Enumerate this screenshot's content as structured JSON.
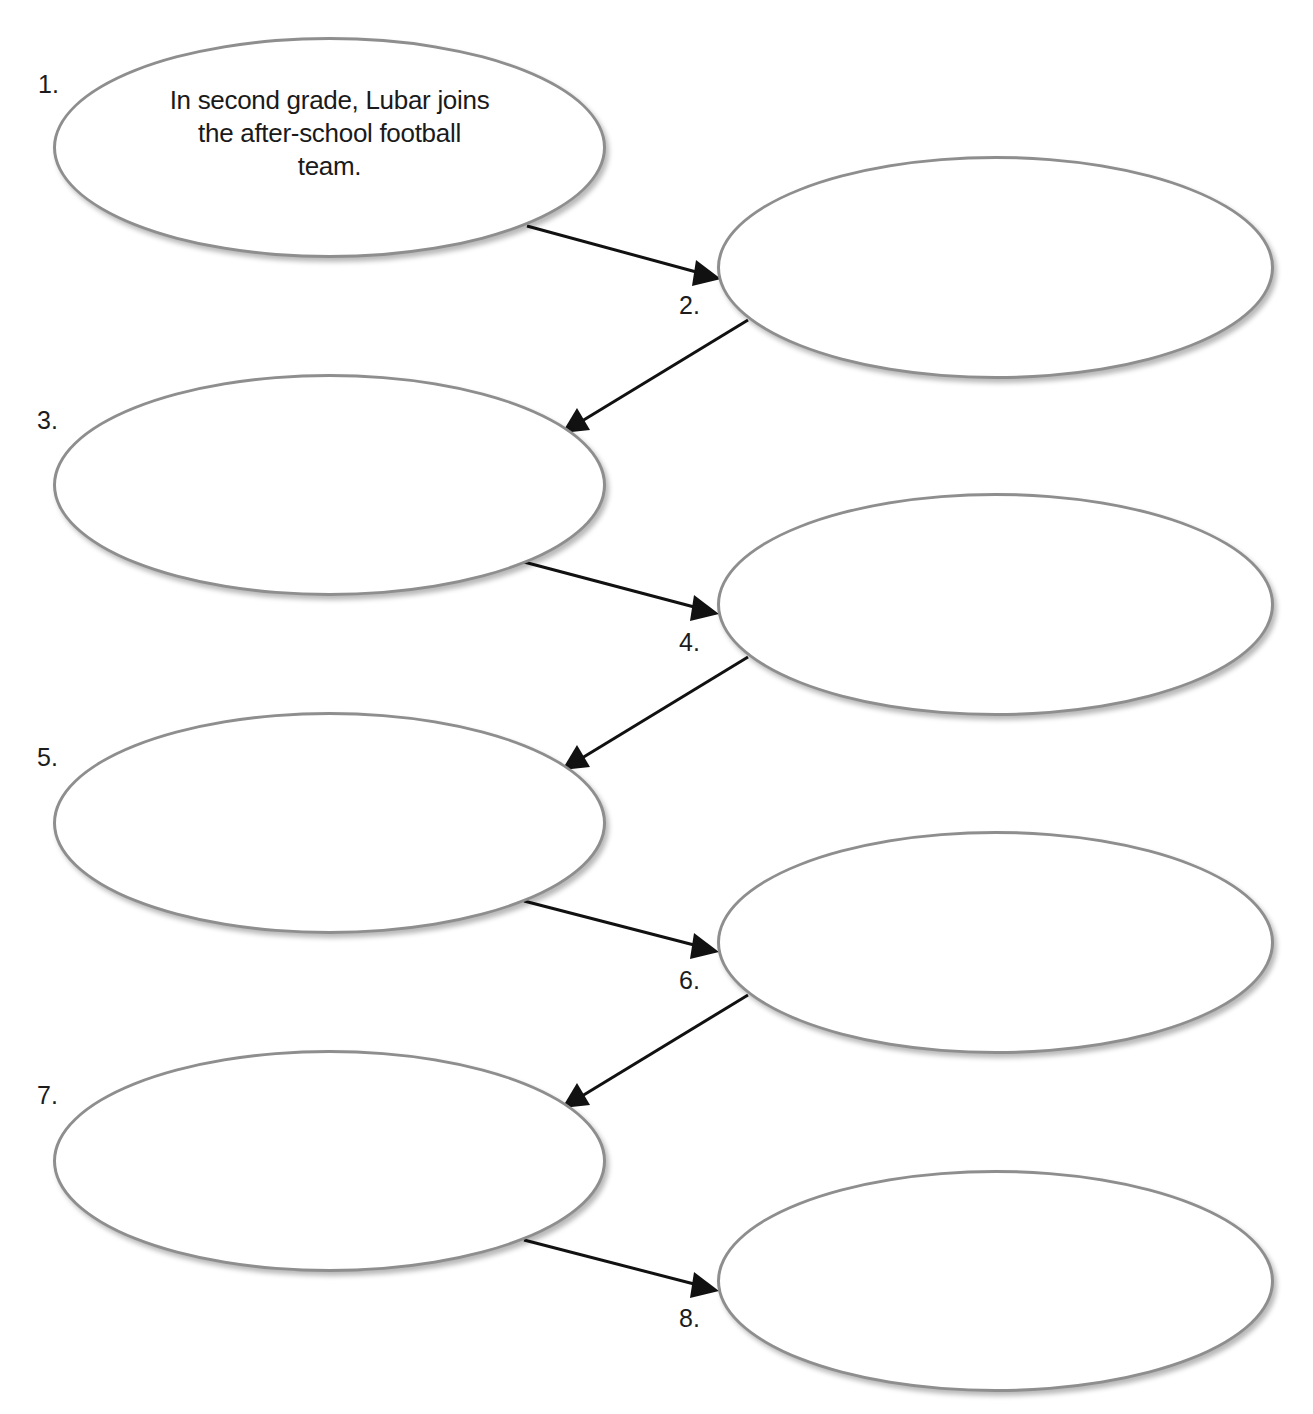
{
  "diagram": {
    "type": "sequence-chain",
    "line_color": "#111111",
    "ellipse_border_color": "#8e8e8e",
    "steps": [
      {
        "number": "1.",
        "text": "In second grade, Lubar joins the after-school football team."
      },
      {
        "number": "2.",
        "text": ""
      },
      {
        "number": "3.",
        "text": ""
      },
      {
        "number": "4.",
        "text": ""
      },
      {
        "number": "5.",
        "text": ""
      },
      {
        "number": "6.",
        "text": ""
      },
      {
        "number": "7.",
        "text": ""
      },
      {
        "number": "8.",
        "text": ""
      }
    ],
    "arrows": [
      {
        "from": "1",
        "to": "2"
      },
      {
        "from": "2",
        "to": "3"
      },
      {
        "from": "3",
        "to": "4"
      },
      {
        "from": "4",
        "to": "5"
      },
      {
        "from": "5",
        "to": "6"
      },
      {
        "from": "6",
        "to": "7"
      },
      {
        "from": "7",
        "to": "8"
      }
    ]
  }
}
